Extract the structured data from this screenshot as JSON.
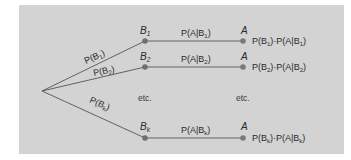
{
  "diagram": {
    "type": "probability-tree",
    "colors": {
      "background": "#d3d3d3",
      "line": "#555555",
      "node": "#6f6f6f",
      "text": "#2a2a2a"
    },
    "root": {
      "x": 42,
      "y": 91
    },
    "branches": [
      {
        "id": "b1",
        "node_label": "B",
        "node_sub": "1",
        "prob_label": "P(B",
        "prob_sub": "1",
        "prob_close": ")",
        "cond_label": "P(A|B",
        "cond_sub": "1",
        "cond_close": ")",
        "outcome_label": "A",
        "product_a": "P(B",
        "product_a_sub": "1",
        "product_mid": ")·P(A|B",
        "product_b_sub": "1",
        "product_close": ")"
      },
      {
        "id": "b2",
        "node_label": "B",
        "node_sub": "2",
        "prob_label": "P(B",
        "prob_sub": "2",
        "prob_close": ")",
        "cond_label": "P(A|B",
        "cond_sub": "2",
        "cond_close": ")",
        "outcome_label": "A",
        "product_a": "P(B",
        "product_a_sub": "2",
        "product_mid": ")·P(A|B",
        "product_b_sub": "2",
        "product_close": ")"
      },
      {
        "id": "bk",
        "node_label": "B",
        "node_sub": "k",
        "prob_label": "P(B",
        "prob_sub": "k",
        "prob_close": ")",
        "cond_label": "P(A|B",
        "cond_sub": "k",
        "cond_close": ")",
        "outcome_label": "A",
        "product_a": "P(B",
        "product_a_sub": "k",
        "product_mid": ")·P(A|B",
        "product_b_sub": "k",
        "product_close": ")"
      }
    ],
    "ellipsis_left": "etc.",
    "ellipsis_right": "etc."
  }
}
